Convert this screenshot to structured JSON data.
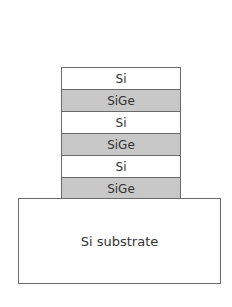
{
  "diagram": {
    "layers": [
      {
        "label": "Si",
        "material": "si",
        "fill": "#ffffff"
      },
      {
        "label": "SiGe",
        "material": "sige",
        "fill": "#c8c8c8"
      },
      {
        "label": "Si",
        "material": "si",
        "fill": "#ffffff"
      },
      {
        "label": "SiGe",
        "material": "sige",
        "fill": "#c8c8c8"
      },
      {
        "label": "Si",
        "material": "si",
        "fill": "#ffffff"
      },
      {
        "label": "SiGe",
        "material": "sige",
        "fill": "#c8c8c8"
      }
    ],
    "substrate": {
      "label": "Si substrate",
      "fill": "#ffffff"
    },
    "border_color": "#6a6a6a"
  }
}
